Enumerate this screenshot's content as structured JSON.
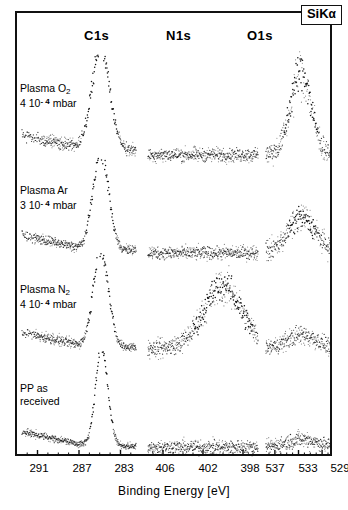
{
  "figure": {
    "corner_label": "SiK",
    "corner_label_sub": "α",
    "axis_title": "Binding  Energy  [eV]"
  },
  "columns": [
    {
      "id": "c1s",
      "label": "C1s"
    },
    {
      "id": "n1s",
      "label": "N1s"
    },
    {
      "id": "o1s",
      "label": "O1s"
    }
  ],
  "rows": [
    {
      "id": "plasma-o2",
      "line1": "Plasma O",
      "sub1": "2",
      "line2_a": "4 10",
      "line2_sup": "- 4",
      "line2_b": " mbar"
    },
    {
      "id": "plasma-ar",
      "line1": "Plasma Ar",
      "sub1": "",
      "line2_a": "3 10",
      "line2_sup": "- 4",
      "line2_b": " mbar"
    },
    {
      "id": "plasma-n2",
      "line1": "Plasma N",
      "sub1": "2",
      "line2_a": "4 10",
      "line2_sup": "- 4",
      "line2_b": " mbar"
    },
    {
      "id": "pp-as-received",
      "line1": "PP as",
      "sub1": "",
      "line2_a": "received",
      "line2_sup": "",
      "line2_b": ""
    }
  ],
  "axes": {
    "c1s_ticks": [
      "291",
      "287",
      "283"
    ],
    "n1s_ticks": [
      "406",
      "402",
      "398"
    ],
    "o1s_ticks": [
      "537",
      "533",
      "529"
    ]
  },
  "chart_data": {
    "type": "line",
    "xlabel": "Binding  Energy  [eV]",
    "ylabel": "",
    "grid": false,
    "legend": "none",
    "panels": [
      {
        "name": "C1s",
        "xlim": [
          292.5,
          281.5
        ],
        "tick_values": [
          291,
          287,
          283
        ],
        "minor_tick_step": 1,
        "traces": [
          {
            "row": "Plasma O2 4 10-4 mbar",
            "peaks": [
              {
                "center": 284.9,
                "height": 1.0,
                "width": 0.85
              }
            ],
            "baseline": 0.1,
            "noise": 0.035
          },
          {
            "row": "Plasma Ar 3 10-4 mbar",
            "peaks": [
              {
                "center": 284.9,
                "height": 1.0,
                "width": 0.75
              }
            ],
            "baseline": 0.08,
            "noise": 0.03
          },
          {
            "row": "Plasma N2 4 10-4 mbar",
            "peaks": [
              {
                "center": 284.9,
                "height": 1.0,
                "width": 0.72
              }
            ],
            "baseline": 0.08,
            "noise": 0.03
          },
          {
            "row": "PP as received",
            "peaks": [
              {
                "center": 284.8,
                "height": 1.0,
                "width": 0.6
              }
            ],
            "baseline": 0.06,
            "noise": 0.022
          }
        ]
      },
      {
        "name": "N1s",
        "xlim": [
          407.5,
          396.5
        ],
        "tick_values": [
          406,
          402,
          398
        ],
        "minor_tick_step": 1,
        "traces": [
          {
            "row": "Plasma O2 4 10-4 mbar",
            "peaks": [],
            "baseline": 0.05,
            "noise": 0.045
          },
          {
            "row": "Plasma Ar 3 10-4 mbar",
            "peaks": [],
            "baseline": 0.05,
            "noise": 0.045
          },
          {
            "row": "Plasma N2 4 10-4 mbar",
            "peaks": [
              {
                "center": 400.0,
                "height": 0.62,
                "width": 1.9
              }
            ],
            "baseline": 0.07,
            "noise": 0.06
          },
          {
            "row": "PP as received",
            "peaks": [],
            "baseline": 0.05,
            "noise": 0.048
          }
        ]
      },
      {
        "name": "O1s",
        "xlim": [
          538.5,
          527.5
        ],
        "tick_values": [
          537,
          533,
          529
        ],
        "minor_tick_step": 1,
        "traces": [
          {
            "row": "Plasma O2 4 10-4 mbar",
            "peaks": [
              {
                "center": 532.6,
                "height": 0.8,
                "width": 1.7
              }
            ],
            "baseline": 0.06,
            "noise": 0.07
          },
          {
            "row": "Plasma Ar 3 10-4 mbar",
            "peaks": [
              {
                "center": 532.4,
                "height": 0.34,
                "width": 2.3
              }
            ],
            "baseline": 0.06,
            "noise": 0.06
          },
          {
            "row": "Plasma N2 4 10-4 mbar",
            "peaks": [
              {
                "center": 532.4,
                "height": 0.14,
                "width": 2.6
              }
            ],
            "baseline": 0.06,
            "noise": 0.055
          },
          {
            "row": "PP as received",
            "peaks": [
              {
                "center": 532.4,
                "height": 0.08,
                "width": 2.6
              }
            ],
            "baseline": 0.05,
            "noise": 0.05
          }
        ]
      }
    ]
  }
}
